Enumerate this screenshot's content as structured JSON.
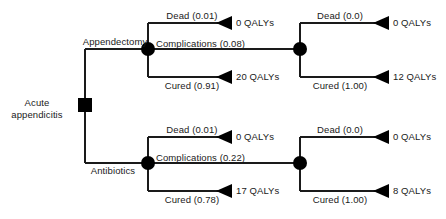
{
  "diagram": {
    "type": "decision-tree",
    "colors": {
      "line": "#1a1a1a",
      "node": "#000000",
      "text": "#1a1a1a",
      "background": "#ffffff"
    },
    "root": {
      "label_line1": "Acute",
      "label_line2": "appendicitis",
      "node_type": "decision-square"
    },
    "strategies": [
      {
        "label": "Appendectomy"
      },
      {
        "label": "Antibiotics"
      }
    ],
    "branches": {
      "appendectomy": {
        "dead": "Dead (0.01)",
        "complications": "Complications (0.08)",
        "cured": "Cured (0.91)",
        "dead_outcome": "0 QALYs",
        "cured_outcome": "20 QALYs",
        "sub": {
          "dead": "Dead (0.0)",
          "cured": "Cured (1.00)",
          "dead_outcome": "0 QALYs",
          "cured_outcome": "12 QALYs"
        }
      },
      "antibiotics": {
        "dead": "Dead (0.01)",
        "complications": "Complications (0.22)",
        "cured": "Cured (0.78)",
        "dead_outcome": "0 QALYs",
        "cured_outcome": "17 QALYs",
        "sub": {
          "dead": "Dead (0.0)",
          "cured": "Cured (1.00)",
          "dead_outcome": "0 QALYs",
          "cured_outcome": "8 QALYs"
        }
      }
    }
  }
}
